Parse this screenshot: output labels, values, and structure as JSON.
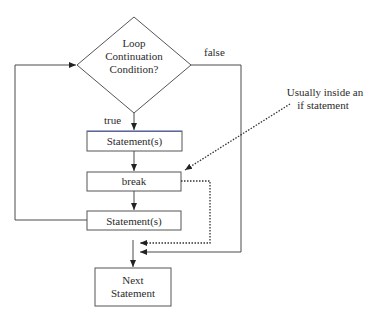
{
  "diagram": {
    "type": "flowchart",
    "decision": {
      "label_lines": [
        "Loop",
        "Continuation",
        "Condition?"
      ],
      "true_label": "true",
      "false_label": "false"
    },
    "boxes": [
      {
        "id": "statements-1",
        "label": "Statement(s)"
      },
      {
        "id": "break",
        "label": "break"
      },
      {
        "id": "statements-2",
        "label": "Statement(s)"
      }
    ],
    "next": {
      "label_lines": [
        "Next",
        "Statement"
      ]
    },
    "annotation": {
      "label_lines": [
        "Usually inside an",
        "if statement"
      ]
    },
    "colors": {
      "line": "#4a4a4a",
      "text": "#2b2b2b",
      "box_top_accent": "#5566bb"
    }
  }
}
